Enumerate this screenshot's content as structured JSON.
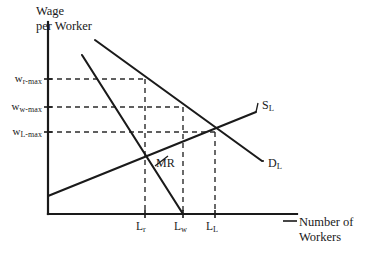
{
  "figure": {
    "axes": {
      "y_title": "Wage\nper Worker",
      "x_title": "Number of\nWorkers",
      "origin": {
        "x": 48,
        "y": 214
      },
      "x_axis_end": {
        "x": 297,
        "y": 214
      },
      "y_axis_top": {
        "x": 48,
        "y": 22
      }
    },
    "colors": {
      "line": "#1a1a1a",
      "dashed": "#2b2b2b",
      "text": "#1a1a1a",
      "background": "#ffffff"
    },
    "curves": [
      {
        "name": "demand",
        "label_main": "D",
        "label_sub": "L",
        "label_pos": {
          "x": 268,
          "y": 164
        },
        "from": {
          "x": 95,
          "y": 40
        },
        "to": {
          "x": 262,
          "y": 161
        }
      },
      {
        "name": "supply",
        "label_main": "S",
        "label_sub": "L",
        "label_pos": {
          "x": 262,
          "y": 106
        },
        "from": {
          "x": 48,
          "y": 196
        },
        "to": {
          "x": 256,
          "y": 112
        }
      },
      {
        "name": "marginal-revenue",
        "label_main": "MR",
        "label_sub": "",
        "label_pos": {
          "x": 156,
          "y": 164
        },
        "from": {
          "x": 82,
          "y": 55
        },
        "to": {
          "x": 183,
          "y": 214
        }
      }
    ],
    "mr_leader_line": {
      "x1": 168,
      "y1": 156,
      "x2": 155,
      "y2": 166
    },
    "wage_levels": [
      {
        "id": "w-r-max",
        "label_main": "w",
        "label_sub": "r-max",
        "y": 79,
        "dash_to_x": 145
      },
      {
        "id": "w-w-max",
        "label_main": "w",
        "label_sub": "w-max",
        "y": 107,
        "dash_to_x": 183
      },
      {
        "id": "w-L-max",
        "label_main": "w",
        "label_sub": "L-max",
        "y": 132,
        "dash_to_x": 215
      }
    ],
    "quantity_levels": [
      {
        "id": "L-r",
        "label_main": "L",
        "label_sub": "r",
        "x": 145,
        "dash_from_y": 79
      },
      {
        "id": "L-w",
        "label_main": "L",
        "label_sub": "w",
        "x": 183,
        "dash_from_y": 107
      },
      {
        "id": "L-L",
        "label_main": "L",
        "label_sub": "L",
        "x": 215,
        "dash_from_y": 132
      }
    ]
  },
  "chart_data": {
    "type": "line",
    "title": "",
    "xlabel": "Number of Workers",
    "ylabel": "Wage per Worker",
    "grid": false,
    "legend": "inline-curve-labels",
    "x_tick_labels": [
      "L_r",
      "L_w",
      "L_L"
    ],
    "y_tick_labels": [
      "w_r-max",
      "w_w-max",
      "w_L-max"
    ],
    "annotations": [
      "MR"
    ],
    "series": [
      {
        "name": "D_L",
        "description": "Labor demand curve, downward sloping",
        "points": [
          [
            95,
            40
          ],
          [
            262,
            161
          ]
        ]
      },
      {
        "name": "S_L",
        "description": "Labor supply curve, upward sloping",
        "points": [
          [
            48,
            196
          ],
          [
            256,
            112
          ]
        ]
      },
      {
        "name": "MR",
        "description": "Marginal revenue curve, steeply downward sloping",
        "points": [
          [
            82,
            55
          ],
          [
            183,
            214
          ]
        ]
      }
    ],
    "equilibria": [
      {
        "label": "L_r at w_r-max",
        "x": 145,
        "y": 79,
        "note": "monopsony-style outcome on demand curve"
      },
      {
        "label": "L_w at w_w-max",
        "x": 183,
        "y": 107,
        "note": "MR meets horizontal axis quantity"
      },
      {
        "label": "L_L at w_L-max",
        "x": 215,
        "y": 132,
        "note": "competitive intersection of S_L and D_L"
      }
    ]
  }
}
